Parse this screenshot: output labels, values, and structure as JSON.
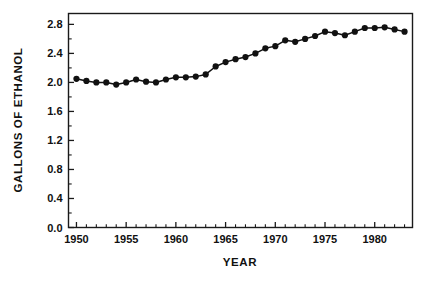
{
  "chart_data": {
    "type": "line",
    "title": "",
    "subtitle": "",
    "xlabel": "YEAR",
    "ylabel": "GALLONS OF ETHANOL",
    "xlim": [
      1949.2,
      1983.8
    ],
    "ylim": [
      0.0,
      2.95
    ],
    "grid": false,
    "legend": null,
    "x_tick_labels": [
      "1950",
      "1955",
      "1960",
      "1965",
      "1970",
      "1975",
      "1980"
    ],
    "x_ticks": [
      1950,
      1955,
      1960,
      1965,
      1970,
      1975,
      1980
    ],
    "x_minor_tick_step": 1,
    "y_tick_labels": [
      "0.0",
      "0.4",
      "0.8",
      "1.2",
      "1.6",
      "2.0",
      "2.4",
      "2.8"
    ],
    "y_ticks": [
      0.0,
      0.4,
      0.8,
      1.2,
      1.6,
      2.0,
      2.4,
      2.8
    ],
    "y_minor_tick_step": 0.2,
    "marker": "filled-circle",
    "marker_size_px": 3.1,
    "line_color": "#111111",
    "marker_color": "#111111",
    "frame_color": "#1a1a1a",
    "background_color": "#ffffff",
    "x": [
      1950,
      1951,
      1952,
      1953,
      1954,
      1955,
      1956,
      1957,
      1958,
      1959,
      1960,
      1961,
      1962,
      1963,
      1964,
      1965,
      1966,
      1967,
      1968,
      1969,
      1970,
      1971,
      1972,
      1973,
      1974,
      1975,
      1976,
      1977,
      1978,
      1979,
      1980,
      1981,
      1982,
      1983
    ],
    "values": [
      2.05,
      2.02,
      2.0,
      2.0,
      1.97,
      2.0,
      2.04,
      2.01,
      2.0,
      2.04,
      2.07,
      2.07,
      2.08,
      2.11,
      2.22,
      2.28,
      2.32,
      2.35,
      2.4,
      2.47,
      2.5,
      2.58,
      2.56,
      2.6,
      2.64,
      2.7,
      2.68,
      2.65,
      2.7,
      2.75,
      2.75,
      2.76,
      2.73,
      2.7
    ],
    "series": [
      {
        "name": "Gallons of ethanol per capita",
        "values": [
          2.05,
          2.02,
          2.0,
          2.0,
          1.97,
          2.0,
          2.04,
          2.01,
          2.0,
          2.04,
          2.07,
          2.07,
          2.08,
          2.11,
          2.22,
          2.28,
          2.32,
          2.35,
          2.4,
          2.47,
          2.5,
          2.58,
          2.56,
          2.6,
          2.64,
          2.7,
          2.68,
          2.65,
          2.7,
          2.75,
          2.75,
          2.76,
          2.73,
          2.7
        ]
      }
    ]
  },
  "axis": {
    "x_title": "YEAR",
    "y_title": "GALLONS OF ETHANOL"
  }
}
